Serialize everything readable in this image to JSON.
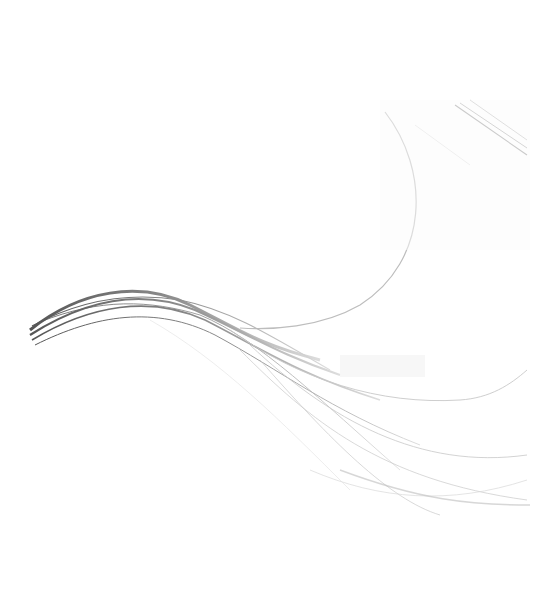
{
  "image": {
    "description": "Abstract decorative background of flowing grey wave lines on white",
    "background_color": "#ffffff",
    "stroke_colors": {
      "dark": "#5a5a5a",
      "mid": "#8c8c8c",
      "light": "#c4c4c4",
      "faint": "#e2e2e2"
    }
  }
}
